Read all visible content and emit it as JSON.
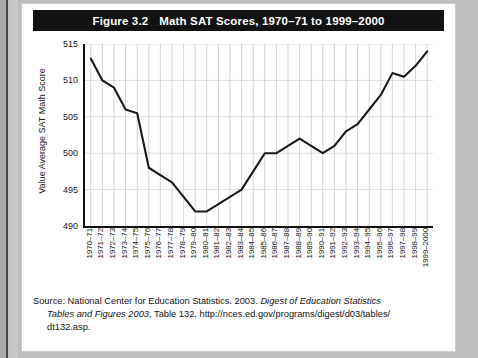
{
  "figure": {
    "number": "Figure 3.2",
    "title": "Math SAT Scores, 1970–71 to 1999–2000"
  },
  "chart_data": {
    "type": "line",
    "title": "Math SAT Scores, 1970–71 to 1999–2000",
    "xlabel": "",
    "ylabel": "Value Average SAT Math Score",
    "ylim": [
      490,
      515
    ],
    "yticks": [
      490,
      495,
      500,
      505,
      510,
      515
    ],
    "grid": true,
    "legend": "none",
    "line_color": "#1a1a1a",
    "categories": [
      "1970–71",
      "1971–72",
      "1972–73",
      "1973–74",
      "1974–75",
      "1975–76",
      "1976–77",
      "1977–78",
      "1978–79",
      "1979–80",
      "1980–81",
      "1981–82",
      "1982–83",
      "1983–84",
      "1984–85",
      "1985–86",
      "1986–87",
      "1987–88",
      "1988–89",
      "1989–90",
      "1990–91",
      "1991–92",
      "1992–93",
      "1993–94",
      "1994–95",
      "1995–96",
      "1996–97",
      "1997–98",
      "1998–99",
      "1999–2000"
    ],
    "values": [
      513,
      510,
      509,
      506,
      505.5,
      498,
      497,
      496,
      494,
      492,
      492,
      493,
      494,
      495,
      497.5,
      500,
      500,
      501,
      502,
      501,
      500,
      501,
      503,
      504,
      506,
      508,
      511,
      510.5,
      512,
      514
    ]
  },
  "source": {
    "line1_a": "Source: National Center for Education Statistics. 2003. ",
    "line1_b": "Digest of Education Statistics",
    "line2_a": "Tables and Figures 2003",
    "line2_b": ", Table 132. http://nces.ed.gov/programs/digest/d03/tables/",
    "line3": "dt132.asp."
  }
}
